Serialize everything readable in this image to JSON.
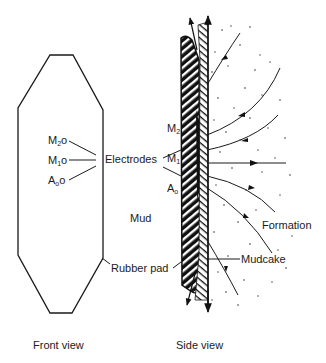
{
  "diagram": {
    "colors": {
      "ink": "#1a1a1a",
      "background": "#ffffff"
    },
    "front_view": {
      "caption": "Front view",
      "electrodes": [
        {
          "base": "M",
          "sub": "2",
          "mark": "o"
        },
        {
          "base": "M",
          "sub": "1",
          "mark": "o"
        },
        {
          "base": "A",
          "sub": "o",
          "mark": "o"
        }
      ],
      "electrodes_label": "Electrodes",
      "rubber_pad_label": "Rubber pad",
      "mud_label": "Mud"
    },
    "side_view": {
      "caption": "Side view",
      "electrodes": [
        {
          "base": "M",
          "sub": "2"
        },
        {
          "base": "M",
          "sub": "1"
        },
        {
          "base": "A",
          "sub": "o"
        }
      ],
      "formation_label": "Formation",
      "mudcake_label": "Mudcake"
    }
  }
}
